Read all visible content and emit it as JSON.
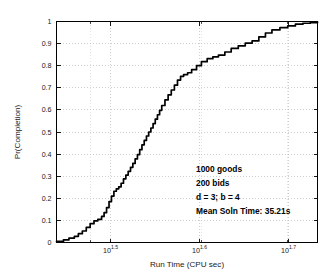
{
  "chart_data": {
    "type": "line",
    "title": "",
    "subtitle": "",
    "xlabel": "Run Time (CPU sec)",
    "ylabel": "Pr(Completion)",
    "xscale": "log",
    "yscale": "linear",
    "xlim": [
      27.5,
      54.0
    ],
    "ylim": [
      0,
      1
    ],
    "grid": true,
    "legend_position": "none",
    "x_tick_labels": [
      "10^1.5",
      "10^1.6",
      "10^1.7"
    ],
    "x_tick_mantissa": [
      "10",
      "10",
      "10"
    ],
    "x_tick_exponents": [
      "1.5",
      "1.6",
      "1.7"
    ],
    "x_tick_values": [
      31.62,
      39.81,
      50.12
    ],
    "y_tick_labels": [
      "0",
      "0.1",
      "0.2",
      "0.3",
      "0.4",
      "0.5",
      "0.6",
      "0.7",
      "0.8",
      "0.9",
      "1"
    ],
    "y_tick_values": [
      0,
      0.1,
      0.2,
      0.3,
      0.4,
      0.5,
      0.6,
      0.7,
      0.8,
      0.9,
      1.0
    ],
    "series": [
      {
        "name": "Empirical CDF of run time",
        "style": "staircase",
        "color": "#000000",
        "x": [
          27.5,
          28.0,
          28.4,
          28.8,
          29.1,
          29.4,
          29.7,
          30.0,
          30.3,
          30.6,
          30.9,
          31.1,
          31.3,
          31.5,
          31.7,
          31.9,
          32.1,
          32.3,
          32.5,
          32.7,
          32.9,
          33.1,
          33.3,
          33.5,
          33.7,
          33.9,
          34.1,
          34.3,
          34.5,
          34.7,
          34.9,
          35.1,
          35.3,
          35.5,
          35.7,
          35.9,
          36.1,
          36.4,
          36.7,
          37.0,
          37.3,
          37.6,
          37.9,
          38.2,
          38.6,
          39.0,
          39.5,
          40.0,
          40.6,
          41.2,
          41.8,
          42.5,
          43.2,
          44.0,
          44.8,
          45.6,
          46.4,
          47.2,
          48.0,
          49.0,
          50.0,
          51.0,
          52.0,
          53.0,
          54.0
        ],
        "y": [
          0.005,
          0.012,
          0.02,
          0.028,
          0.04,
          0.052,
          0.068,
          0.085,
          0.098,
          0.105,
          0.118,
          0.135,
          0.158,
          0.185,
          0.21,
          0.232,
          0.243,
          0.252,
          0.268,
          0.288,
          0.305,
          0.322,
          0.34,
          0.358,
          0.378,
          0.398,
          0.42,
          0.442,
          0.462,
          0.482,
          0.5,
          0.518,
          0.538,
          0.558,
          0.578,
          0.598,
          0.62,
          0.645,
          0.668,
          0.69,
          0.712,
          0.735,
          0.752,
          0.76,
          0.768,
          0.782,
          0.8,
          0.818,
          0.832,
          0.84,
          0.848,
          0.862,
          0.878,
          0.89,
          0.902,
          0.912,
          0.93,
          0.948,
          0.962,
          0.972,
          0.98,
          0.988,
          0.992,
          0.995,
          0.998
        ]
      }
    ],
    "annotations": {
      "lines": [
        "1000 goods",
        "200 bids",
        "d = 3; b = 4",
        "Mean Soln Time: 35.21s"
      ]
    }
  }
}
